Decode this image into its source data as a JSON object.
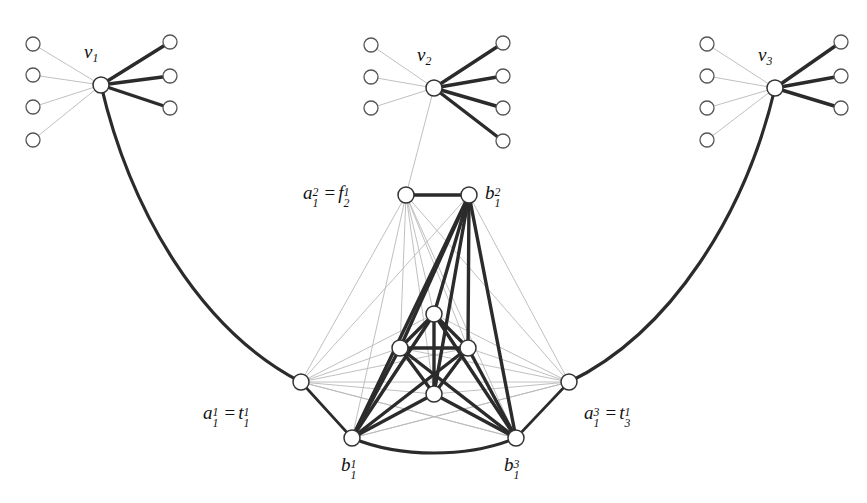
{
  "figure": {
    "background_color": "#ffffff",
    "node_fill": "#ffffff",
    "node_stroke": "#333333",
    "edge_dark_color": "#2b2b2b",
    "edge_light_color": "#b9b9b9"
  },
  "labels": {
    "v1": "v",
    "v1_sub": "1",
    "v2": "v",
    "v2_sub": "2",
    "v3": "v",
    "v3_sub": "3",
    "a12_base": "a",
    "a12_sub": "1",
    "a12_sup": "2",
    "eq": "=",
    "f21_base": "f",
    "f21_sub": "2",
    "f21_sup": "1",
    "b12_base": "b",
    "b12_sub": "1",
    "b12_sup": "2",
    "a11_base": "a",
    "a11_sub": "1",
    "a11_sup": "1",
    "t11_base": "t",
    "t11_sub": "1",
    "t11_sup": "1",
    "b11_base": "b",
    "b11_sub": "1",
    "b11_sup": "1",
    "a13_base": "a",
    "a13_sub": "1",
    "a13_sup": "3",
    "t31_base": "t",
    "t31_sub": "3",
    "t31_sup": "1",
    "b13_base": "b",
    "b13_sub": "1",
    "b13_sup": "3"
  },
  "nodes": {
    "v1": {
      "name": "v1",
      "x": 101,
      "y": 85,
      "r": 8
    },
    "v2": {
      "name": "v2",
      "x": 434,
      "y": 88,
      "r": 8
    },
    "v3": {
      "name": "v3",
      "x": 775,
      "y": 88,
      "r": 8
    },
    "a12": {
      "name": "a_1^2 = f_2^1",
      "x": 406,
      "y": 195,
      "r": 8
    },
    "b12": {
      "name": "b_1^2",
      "x": 469,
      "y": 195,
      "r": 8
    },
    "a11": {
      "name": "a_1^1 = t_1^1",
      "x": 301,
      "y": 382,
      "r": 8
    },
    "a13": {
      "name": "a_1^3 = t_3^1",
      "x": 569,
      "y": 382,
      "r": 8
    },
    "b11": {
      "name": "b_1^1",
      "x": 352,
      "y": 438,
      "r": 8
    },
    "b13": {
      "name": "b_1^3",
      "x": 516,
      "y": 438,
      "r": 8
    },
    "c_top": {
      "name": "inner-top",
      "x": 434,
      "y": 314,
      "r": 8
    },
    "c_left": {
      "name": "inner-left",
      "x": 400,
      "y": 348,
      "r": 8
    },
    "c_right": {
      "name": "inner-right",
      "x": 468,
      "y": 348,
      "r": 8
    },
    "c_bottom": {
      "name": "inner-bottom",
      "x": 434,
      "y": 394,
      "r": 8
    }
  },
  "leaves": {
    "v1_light": [
      {
        "x": 33,
        "y": 44
      },
      {
        "x": 33,
        "y": 75
      },
      {
        "x": 33,
        "y": 107
      },
      {
        "x": 33,
        "y": 140
      }
    ],
    "v1_dark": [
      {
        "x": 170,
        "y": 42
      },
      {
        "x": 170,
        "y": 76
      },
      {
        "x": 170,
        "y": 108
      }
    ],
    "v2_light": [
      {
        "x": 371,
        "y": 45
      },
      {
        "x": 371,
        "y": 77
      },
      {
        "x": 371,
        "y": 108
      }
    ],
    "v2_dark": [
      {
        "x": 503,
        "y": 43
      },
      {
        "x": 503,
        "y": 76
      },
      {
        "x": 503,
        "y": 108
      },
      {
        "x": 503,
        "y": 141
      }
    ],
    "v3_light": [
      {
        "x": 707,
        "y": 44
      },
      {
        "x": 707,
        "y": 76
      },
      {
        "x": 707,
        "y": 108
      },
      {
        "x": 707,
        "y": 140
      }
    ],
    "v3_dark": [
      {
        "x": 841,
        "y": 42
      },
      {
        "x": 841,
        "y": 76
      },
      {
        "x": 841,
        "y": 108
      }
    ]
  },
  "label_positions": {
    "v1": {
      "x": 84,
      "y": 50
    },
    "v2": {
      "x": 417,
      "y": 53
    },
    "v3": {
      "x": 758,
      "y": 53
    },
    "a12_eq_f21": {
      "x": 303,
      "y": 181
    },
    "b12": {
      "x": 484,
      "y": 182
    },
    "a11_eq_t11": {
      "x": 203,
      "y": 411
    },
    "b11": {
      "x": 340,
      "y": 457
    },
    "a13_eq_t31": {
      "x": 584,
      "y": 411
    },
    "b13": {
      "x": 503,
      "y": 457
    }
  }
}
